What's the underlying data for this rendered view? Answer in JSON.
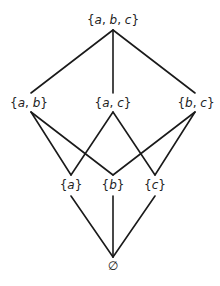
{
  "diagram": {
    "type": "hasse-diagram",
    "line_color": "#1a1a1a",
    "text_color": "#222222",
    "nodes": [
      {
        "id": "abc",
        "label": "{a, b, c}",
        "x": 113,
        "y": 20,
        "level": 3
      },
      {
        "id": "ab",
        "label": "{a, b}",
        "x": 29,
        "y": 103,
        "level": 2
      },
      {
        "id": "ac",
        "label": "{a, c}",
        "x": 113,
        "y": 103,
        "level": 2
      },
      {
        "id": "bc",
        "label": "{b, c}",
        "x": 196,
        "y": 103,
        "level": 2
      },
      {
        "id": "a",
        "label": "{a}",
        "x": 71,
        "y": 185,
        "level": 1
      },
      {
        "id": "b",
        "label": "{b}",
        "x": 113,
        "y": 185,
        "level": 1
      },
      {
        "id": "c",
        "label": "{c}",
        "x": 155,
        "y": 185,
        "level": 1
      },
      {
        "id": "empty",
        "label": "∅",
        "x": 113,
        "y": 266,
        "level": 0
      }
    ],
    "edges": [
      {
        "from": "abc",
        "to": "ab"
      },
      {
        "from": "abc",
        "to": "ac"
      },
      {
        "from": "abc",
        "to": "bc"
      },
      {
        "from": "ab",
        "to": "a"
      },
      {
        "from": "ab",
        "to": "b"
      },
      {
        "from": "ac",
        "to": "a"
      },
      {
        "from": "ac",
        "to": "c"
      },
      {
        "from": "bc",
        "to": "b"
      },
      {
        "from": "bc",
        "to": "c"
      },
      {
        "from": "a",
        "to": "empty"
      },
      {
        "from": "b",
        "to": "empty"
      },
      {
        "from": "c",
        "to": "empty"
      }
    ]
  }
}
